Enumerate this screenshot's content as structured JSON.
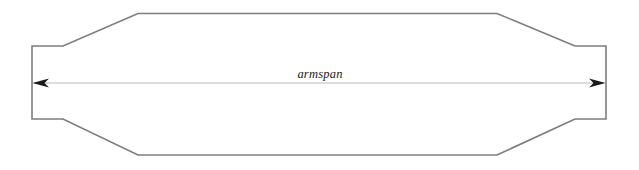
{
  "diagram": {
    "canvas": {
      "width": 639,
      "height": 170,
      "background": "#ffffff"
    },
    "outline": {
      "name": "body-outline-shape",
      "stroke_color": "#7d7d7d",
      "stroke_width": 1.6,
      "fill": "none",
      "description": "symmetric elongated octagon with rectangular end stubs"
    },
    "dimension": {
      "label": "armspan",
      "label_x": 320,
      "label_y": 78,
      "line_color": "#b9b9b9",
      "line_width": 1,
      "arrowhead_color": "#1a1a1a",
      "start_x": 34,
      "end_x": 604,
      "y": 83,
      "left_arrow_icon": "arrow-left-icon",
      "right_arrow_icon": "arrow-right-icon"
    },
    "geometry": {
      "left_edge_x": 32,
      "right_edge_x": 606,
      "stub_top_y": 46,
      "stub_bottom_y": 119,
      "neck_left_x": 63,
      "neck_right_x": 575,
      "shoulder_left_x": 138,
      "shoulder_right_x": 497,
      "top_y": 13,
      "bottom_y": 155,
      "path": "M 32 46 L 63 46 L 138 13.5 L 497 13.5 L 575 46 L 606 46 L 606 119 L 575 119 L 497 155 L 138 155 L 63 119 L 32 119 Z"
    }
  }
}
